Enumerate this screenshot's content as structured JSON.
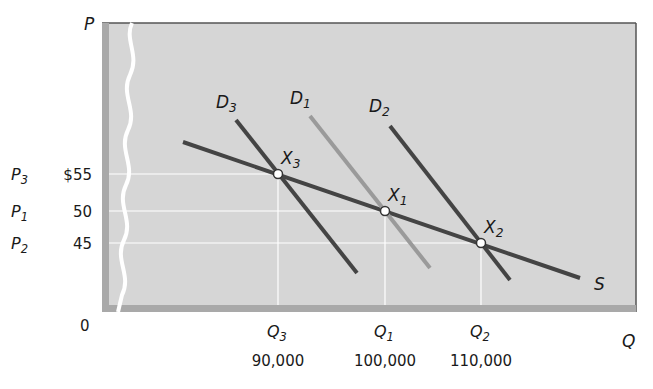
{
  "chart_data": {
    "type": "line",
    "title": "",
    "xlabel": "Q",
    "ylabel": "P",
    "origin_label": "0",
    "grid": true,
    "axis_break": "y-axis wavy break",
    "x_ticks": [
      {
        "symbol": "Q",
        "sub": "3",
        "value": "90,000",
        "x": 278
      },
      {
        "symbol": "Q",
        "sub": "1",
        "value": "100,000",
        "x": 385
      },
      {
        "symbol": "Q",
        "sub": "2",
        "value": "110,000",
        "x": 481
      }
    ],
    "y_ticks": [
      {
        "symbol": "P",
        "sub": "3",
        "value": "$55",
        "y": 174
      },
      {
        "symbol": "P",
        "sub": "1",
        "value": "50",
        "y": 211
      },
      {
        "symbol": "P",
        "sub": "2",
        "value": "45",
        "y": 243
      }
    ],
    "series": [
      {
        "name": "S",
        "label": "S",
        "color": "#444444",
        "x1": 183,
        "y1": 142,
        "x2": 580,
        "y2": 278,
        "label_pos": [
          594,
          290
        ]
      },
      {
        "name": "D3",
        "label": "D",
        "sub": "3",
        "color": "#444444",
        "x1": 236,
        "y1": 120,
        "x2": 357,
        "y2": 273,
        "label_pos": [
          216,
          108
        ]
      },
      {
        "name": "D1",
        "label": "D",
        "sub": "1",
        "color": "#9a9a9a",
        "x1": 310,
        "y1": 116,
        "x2": 430,
        "y2": 268,
        "label_pos": [
          290,
          104
        ]
      },
      {
        "name": "D2",
        "label": "D",
        "sub": "2",
        "color": "#444444",
        "x1": 390,
        "y1": 126,
        "x2": 510,
        "y2": 280,
        "label_pos": [
          369,
          112
        ]
      }
    ],
    "points": [
      {
        "name": "X3",
        "label": "X",
        "sub": "3",
        "q": "90,000",
        "p": "$55",
        "x": 278,
        "y": 174
      },
      {
        "name": "X1",
        "label": "X",
        "sub": "1",
        "q": "100,000",
        "p": "50",
        "x": 385,
        "y": 211
      },
      {
        "name": "X2",
        "label": "X",
        "sub": "2",
        "q": "110,000",
        "p": "45",
        "x": 481,
        "y": 243
      }
    ],
    "colors": {
      "plot_bg": "#d6d6d6",
      "frame_shadow": "#a9a9a9",
      "gridline": "#ffffff"
    }
  }
}
